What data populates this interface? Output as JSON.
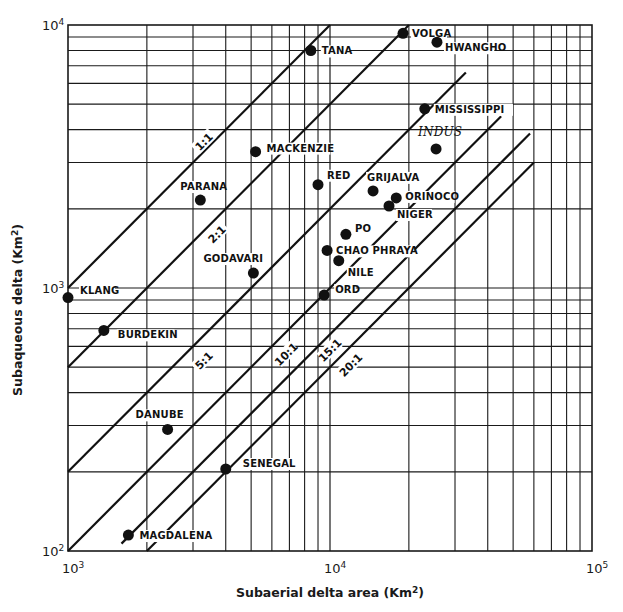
{
  "chart_data": {
    "type": "scatter",
    "title": "",
    "xlabel": "Subaerial delta area (Km2)",
    "ylabel": "Subaqueous delta (Km2)",
    "xscale": "log",
    "yscale": "log",
    "xlim": [
      1000,
      100000
    ],
    "ylim": [
      100,
      10000
    ],
    "grid": true,
    "x_ticks": [
      {
        "value": 1000,
        "base": "10",
        "exp": "3"
      },
      {
        "value": 10000,
        "base": "10",
        "exp": "4"
      },
      {
        "value": 100000,
        "base": "10",
        "exp": "5"
      }
    ],
    "y_ticks": [
      {
        "value": 100,
        "base": "10",
        "exp": "2"
      },
      {
        "value": 1000,
        "base": "10",
        "exp": "3"
      },
      {
        "value": 10000,
        "base": "10",
        "exp": "4"
      }
    ],
    "ratio_lines": [
      {
        "label": "1:1",
        "ratio": 1,
        "x_start": 1000,
        "x_end": 11500,
        "label_x": 3300,
        "label_y": 3600
      },
      {
        "label": "2:1",
        "ratio": 2,
        "x_start": 1000,
        "x_end": 20000,
        "label_x": 3700,
        "label_y": 1600
      },
      {
        "label": "5:1",
        "ratio": 5,
        "x_start": 1000,
        "x_end": 33000,
        "label_x": 3300,
        "label_y": 530
      },
      {
        "label": "10:1",
        "ratio": 10,
        "x_start": 1000,
        "x_end": 45000,
        "label_x": 6800,
        "label_y": 560
      },
      {
        "label": "15:1",
        "ratio": 15,
        "x_start": 1600,
        "x_end": 58000,
        "label_x": 10000,
        "label_y": 580
      },
      {
        "label": "20:1",
        "ratio": 20,
        "x_start": 2000,
        "x_end": 60000,
        "label_x": 12000,
        "label_y": 510
      }
    ],
    "points": [
      {
        "name": "KLANG",
        "x": 1000,
        "y": 920,
        "label_dx": 12,
        "label_dy": -4
      },
      {
        "name": "BURDEKIN",
        "x": 1370,
        "y": 690,
        "label_dx": 14,
        "label_dy": 8
      },
      {
        "name": "DANUBE",
        "x": 2400,
        "y": 290,
        "label_dx": -32,
        "label_dy": -11
      },
      {
        "name": "MAGDALENA",
        "x": 1700,
        "y": 115,
        "label_dx": 11,
        "label_dy": 4
      },
      {
        "name": "SENEGAL",
        "x": 4000,
        "y": 205,
        "label_dx": 17,
        "label_dy": -2
      },
      {
        "name": "PARANA",
        "x": 3200,
        "y": 2160,
        "label_dx": -20,
        "label_dy": -10
      },
      {
        "name": "MACKENZIE",
        "x": 5200,
        "y": 3300,
        "label_dx": 11,
        "label_dy": 0
      },
      {
        "name": "GODAVARI",
        "x": 5100,
        "y": 1140,
        "label_dx": -50,
        "label_dy": -11
      },
      {
        "name": "TANA",
        "x": 8450,
        "y": 8000,
        "label_dx": 11,
        "label_dy": 4
      },
      {
        "name": "VOLGA",
        "x": 19000,
        "y": 9300,
        "label_dx": 9,
        "label_dy": 4
      },
      {
        "name": "HWANGHO",
        "x": 25600,
        "y": 8600,
        "label_dx": 8,
        "label_dy": 9
      },
      {
        "name": "MISSISSIPPI",
        "x": 23000,
        "y": 4800,
        "label_dx": 10,
        "label_dy": 4
      },
      {
        "name": "INDUS",
        "x": 25400,
        "y": 3380,
        "label_dx": -18,
        "label_dy": -13,
        "italic": true
      },
      {
        "name": "RED",
        "x": 9000,
        "y": 2470,
        "label_dx": 9,
        "label_dy": -6
      },
      {
        "name": "GRIJALVA",
        "x": 14600,
        "y": 2340,
        "label_dx": -6,
        "label_dy": -10
      },
      {
        "name": "ORINOCO",
        "x": 17900,
        "y": 2200,
        "label_dx": 9,
        "label_dy": 2
      },
      {
        "name": "NIGER",
        "x": 16800,
        "y": 2050,
        "label_dx": 8,
        "label_dy": 12
      },
      {
        "name": "PO",
        "x": 11500,
        "y": 1600,
        "label_dx": 9,
        "label_dy": -2
      },
      {
        "name": "CHAO PHRAYA",
        "x": 9750,
        "y": 1390,
        "label_dx": 9,
        "label_dy": 4
      },
      {
        "name": "NILE",
        "x": 10800,
        "y": 1270,
        "label_dx": 9,
        "label_dy": 15
      },
      {
        "name": "ORD",
        "x": 9500,
        "y": 940,
        "label_dx": 11,
        "label_dy": -2
      }
    ]
  },
  "axes": {
    "xlabel_main": "Subaerial delta area (Km",
    "xlabel_sup": "2",
    "xlabel_end": ")",
    "ylabel_main": "Subaqueous delta (Km",
    "ylabel_sup": "2",
    "ylabel_end": ")"
  },
  "style": {
    "ink": "#1a1a1a",
    "background": "#ffffff"
  }
}
